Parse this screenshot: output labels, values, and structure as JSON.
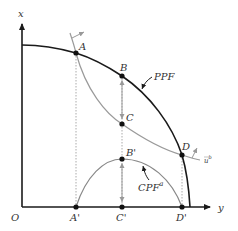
{
  "diagram": {
    "axes": {
      "vertical_label": "x",
      "horizontal_label": "y",
      "origin_label": "O"
    },
    "curves": {
      "ppf_label": "PPF",
      "cpf_label": "CPF",
      "cpf_superscript": "a",
      "indifference_label": "u",
      "indifference_superscript": "b"
    },
    "points": {
      "A": "A",
      "B": "B",
      "C": "C",
      "D": "D",
      "A_prime": "A'",
      "B_prime": "B'",
      "C_prime": "C'",
      "D_prime": "D'"
    },
    "colors": {
      "axis": "#1a1a1a",
      "ppf": "#1a1a1a",
      "indifference": "#9a9a9a",
      "cpf": "#888888",
      "dotted": "#aaaaaa",
      "arrow_gray": "#999999"
    }
  }
}
